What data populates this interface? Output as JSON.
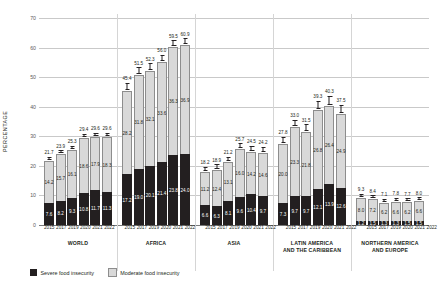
{
  "chart_data": {
    "type": "bar",
    "subtype": "stacked-bar-grouped",
    "title": "",
    "xlabel": "",
    "ylabel": "PERCENTAGE",
    "ylim": [
      0,
      70
    ],
    "yticks": [
      0,
      10,
      20,
      30,
      40,
      50,
      60,
      70
    ],
    "grid": true,
    "legend_position": "bottom-left",
    "categories": [
      "2015",
      "2017",
      "2019",
      "2020",
      "2021",
      "2022"
    ],
    "series": [
      {
        "name": "Severe food insecurity",
        "color": "#231f20"
      },
      {
        "name": "Moderate food insecurity",
        "color": "#d9d9d9"
      }
    ],
    "groups": [
      {
        "name": "WORLD",
        "name_lines": [
          "WORLD"
        ],
        "severe": [
          7.6,
          8.2,
          9.3,
          10.8,
          11.7,
          11.3
        ],
        "moderate": [
          14.2,
          15.7,
          16.1,
          18.6,
          17.9,
          18.3
        ],
        "total": [
          21.7,
          23.9,
          25.3,
          29.4,
          29.6,
          29.6
        ],
        "err": [
          0.5,
          0.5,
          0.5,
          0.6,
          0.6,
          0.6
        ]
      },
      {
        "name": "AFRICA",
        "name_lines": [
          "AFRICA"
        ],
        "severe": [
          17.2,
          19.0,
          20.1,
          21.4,
          23.8,
          24.0
        ],
        "moderate": [
          28.2,
          31.8,
          32.1,
          33.6,
          36.3,
          36.9
        ],
        "total": [
          45.4,
          51.5,
          52.3,
          56.0,
          59.5,
          60.9
        ],
        "err": [
          1.2,
          1.1,
          1.1,
          1.1,
          1.0,
          1.0
        ]
      },
      {
        "name": "ASIA",
        "name_lines": [
          "ASIA"
        ],
        "severe": [
          6.6,
          6.3,
          8.1,
          9.6,
          10.4,
          9.7
        ],
        "moderate": [
          11.2,
          12.4,
          13.1,
          16.0,
          14.2,
          14.6
        ],
        "total": [
          18.2,
          18.9,
          21.2,
          25.7,
          24.5,
          24.2
        ],
        "err": [
          0.8,
          0.8,
          0.8,
          0.9,
          0.9,
          0.9
        ]
      },
      {
        "name": "LATIN AMERICA AND THE CARIBBEAN",
        "name_lines": [
          "LATIN AMERICA",
          "AND THE CARIBBEAN"
        ],
        "severe": [
          7.3,
          9.7,
          9.7,
          12.1,
          13.9,
          12.6
        ],
        "moderate": [
          20.0,
          23.3,
          21.8,
          26.8,
          26.4,
          24.9
        ],
        "total": [
          27.8,
          33.0,
          31.5,
          39.3,
          40.3,
          37.5
        ],
        "err": [
          1.1,
          1.1,
          1.1,
          1.4,
          1.5,
          1.4
        ]
      },
      {
        "name": "NORTHERN AMERICA AND EUROPE",
        "name_lines": [
          "NORTHERN AMERICA",
          "AND EUROPE"
        ],
        "severe": [
          1.2,
          1.5,
          1.3,
          1.3,
          1.5,
          1.5
        ],
        "moderate": [
          8.0,
          7.2,
          6.2,
          6.6,
          6.2,
          6.6
        ],
        "total": [
          9.3,
          8.4,
          7.1,
          7.8,
          7.7,
          8.0
        ],
        "err": [
          0.4,
          0.4,
          0.4,
          0.4,
          0.4,
          0.4
        ]
      }
    ]
  },
  "legend": {
    "items": [
      {
        "label": "Severe food insecurity",
        "swatch": "severe-swatch"
      },
      {
        "label": "Moderate food insecurity",
        "swatch": "moderate-swatch"
      }
    ]
  },
  "axis": {
    "y_title": "PERCENTAGE"
  }
}
